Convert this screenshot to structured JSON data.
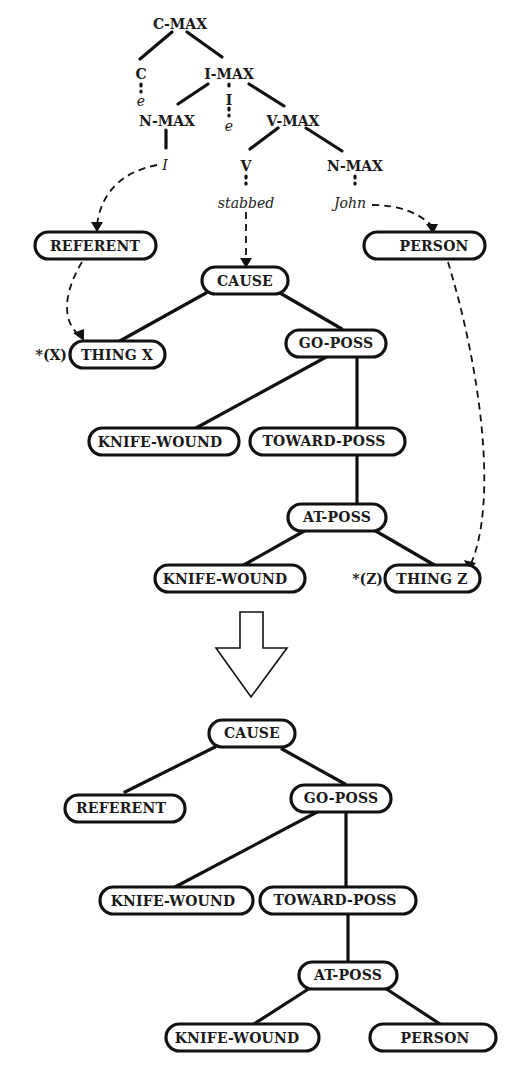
{
  "syntax_tree": {
    "c_max": "C-MAX",
    "c": "C",
    "c_empty": "e",
    "i_max": "I-MAX",
    "i": "I",
    "i_empty": "e",
    "n_max_subject": "N-MAX",
    "subject_word": "I",
    "v_max": "V-MAX",
    "v": "V",
    "verb_word": "stabbed",
    "n_max_object": "N-MAX",
    "object_word": "John"
  },
  "lexical_structures": {
    "referent": "REFERENT",
    "person": "PERSON",
    "cause": "CAUSE",
    "thing_x_marker": "*(X)",
    "thing_x": "THING X",
    "go_poss": "GO-POSS",
    "knife_wound_1": "KNIFE-WOUND",
    "toward_poss": "TOWARD-POSS",
    "at_poss": "AT-POSS",
    "knife_wound_2": "KNIFE-WOUND",
    "thing_z_marker": "*(Z)",
    "thing_z": "THING Z"
  },
  "result_structure": {
    "cause": "CAUSE",
    "referent": "REFERENT",
    "go_poss": "GO-POSS",
    "knife_wound_1": "KNIFE-WOUND",
    "toward_poss": "TOWARD-POSS",
    "at_poss": "AT-POSS",
    "knife_wound_2": "KNIFE-WOUND",
    "person": "PERSON"
  },
  "transform_arrow": "down-arrow-icon"
}
